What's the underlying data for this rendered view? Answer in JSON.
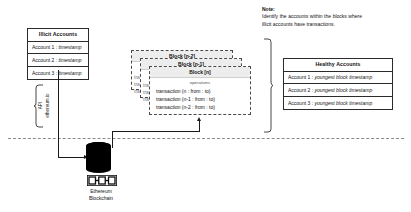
{
  "illicit_accounts": {
    "header": "Illicit Accounts",
    "rows": [
      {
        "label": "Account 1 : ",
        "value": "timestamp"
      },
      {
        "label": "Account 2 : ",
        "value": "timestamp"
      },
      {
        "label": "Account 3 : ",
        "value": "timestamp"
      }
    ]
  },
  "healthy_accounts": {
    "header": "Healthy Accounts",
    "rows": [
      {
        "label": "Account 1 : ",
        "value": "youngest block timestamp"
      },
      {
        "label": "Account 2 : ",
        "value": "youngest block timestamp"
      },
      {
        "label": "Account 3 : ",
        "value": "youngest block timestamp"
      }
    ]
  },
  "note": {
    "title": "Note:",
    "body": "Identify the accounts within the blocks where illicit accounts have transactions."
  },
  "blocks": {
    "back": {
      "header": "Block [n-2]"
    },
    "middle": {
      "header": "Block [n-1]"
    },
    "front": {
      "header": "Block [n]",
      "operations_label": "operations",
      "transactions": [
        "transaction (n : from : to)",
        "transaction (n-1 : from : to)",
        "transaction (n-2 : from : to)"
      ]
    },
    "ghost_transactions": [
      "tra",
      "tra",
      "tra",
      "tra",
      "tra",
      "tra"
    ]
  },
  "api_connector": {
    "line_1": "API",
    "line_2": "ethereum.io"
  },
  "blockchain_node": {
    "label_line_1": "Ethereum",
    "label_line_2": "Blockchain",
    "icon": "blockchain-chain-icon"
  },
  "colors": {
    "stroke": "#2b2b2b",
    "block_header_fill": "#ededed",
    "dashed_stroke": "#4a4a4a",
    "divider": "#8a8a8a",
    "node_fill": "#000000"
  }
}
